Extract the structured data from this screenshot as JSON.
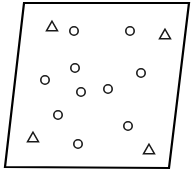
{
  "figure": {
    "canvas": {
      "width": 194,
      "height": 181,
      "background": "#ffffff"
    },
    "boundary": {
      "name": "quadrilateral-region",
      "shape": "quadrilateral",
      "stroke_color": "#000000",
      "fill_color": "#ffffff",
      "stroke_width": 2.2,
      "vertices": [
        {
          "label": "top-left",
          "x": 24,
          "y": 3
        },
        {
          "label": "top-right",
          "x": 189,
          "y": 3
        },
        {
          "label": "bottom-right",
          "x": 169,
          "y": 168
        },
        {
          "label": "bottom-left",
          "x": 5,
          "y": 167
        }
      ]
    }
  },
  "chart_data": {
    "type": "scatter",
    "title": "",
    "xlabel": "",
    "ylabel": "",
    "xlim": [
      0,
      194
    ],
    "ylim": [
      0,
      181
    ],
    "grid": false,
    "legend": "none",
    "axes_visible": false,
    "marker_stroke_color": "#1a1a1a",
    "marker_fill_color": "#ffffff",
    "counts": {
      "circle": 11,
      "triangle": 4,
      "total": 15
    },
    "series": [
      {
        "name": "circle",
        "marker": "circle",
        "radius": 4.2,
        "count": 11,
        "points": [
          {
            "x": 74,
            "y": 31
          },
          {
            "x": 130,
            "y": 31
          },
          {
            "x": 75,
            "y": 68
          },
          {
            "x": 141,
            "y": 73
          },
          {
            "x": 45,
            "y": 80
          },
          {
            "x": 108,
            "y": 89
          },
          {
            "x": 81,
            "y": 92
          },
          {
            "x": 58,
            "y": 115
          },
          {
            "x": 128,
            "y": 126
          },
          {
            "x": 78,
            "y": 144
          }
        ]
      },
      {
        "name": "triangle",
        "marker": "triangle-up",
        "size": 11,
        "count": 4,
        "points": [
          {
            "x": 52,
            "y": 26
          },
          {
            "x": 165,
            "y": 34
          },
          {
            "x": 33,
            "y": 137
          },
          {
            "x": 149,
            "y": 149
          }
        ]
      }
    ]
  }
}
